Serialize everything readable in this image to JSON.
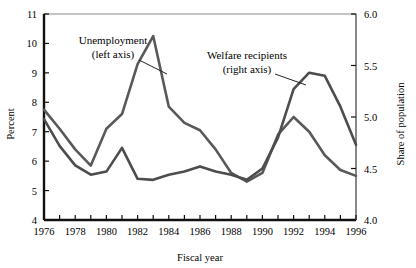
{
  "chart_data": {
    "type": "line",
    "title": "",
    "xlabel": "Fiscal year",
    "ylabel": "Percent",
    "y2label": "Share of population",
    "grid": false,
    "legend_position": "inline-annotations",
    "x": [
      1976,
      1977,
      1978,
      1979,
      1980,
      1981,
      1982,
      1983,
      1984,
      1985,
      1986,
      1987,
      1988,
      1989,
      1990,
      1991,
      1992,
      1993,
      1994,
      1995,
      1996
    ],
    "xlim": [
      1976,
      1996
    ],
    "xticks": [
      1976,
      1977,
      1978,
      1979,
      1980,
      1981,
      1982,
      1983,
      1984,
      1985,
      1986,
      1987,
      1988,
      1989,
      1990,
      1991,
      1992,
      1993,
      1994,
      1995,
      1996
    ],
    "xtick_labels": [
      "1976",
      "",
      "1978",
      "",
      "1980",
      "",
      "1982",
      "",
      "1984",
      "",
      "1986",
      "",
      "1988",
      "",
      "1990",
      "",
      "1992",
      "",
      "1994",
      "",
      "1996"
    ],
    "ylim": [
      4,
      11
    ],
    "yticks": [
      4,
      5,
      6,
      7,
      8,
      9,
      10,
      11
    ],
    "ytick_labels": [
      "4",
      "5",
      "6",
      "7",
      "8",
      "9",
      "10",
      "11"
    ],
    "y2lim": [
      4.0,
      6.0
    ],
    "y2ticks": [
      4.0,
      4.5,
      5.0,
      5.5,
      6.0
    ],
    "y2tick_labels": [
      "4.0",
      "4.5",
      "5.0",
      "5.5",
      "6.0"
    ],
    "series": [
      {
        "name": "Unemployment",
        "axis": "left",
        "color": "#595959",
        "annotation": "Unemployment\n(left axis)",
        "values": [
          7.75,
          7.1,
          6.4,
          5.85,
          7.1,
          7.6,
          9.3,
          10.25,
          7.85,
          7.3,
          7.05,
          6.4,
          5.6,
          5.3,
          5.6,
          6.9,
          7.5,
          7.0,
          6.2,
          5.7,
          5.5
        ]
      },
      {
        "name": "Welfare recipients",
        "axis": "right",
        "color": "#4d4d4d",
        "annotation": "Welfare recipients\n(right axis)",
        "values": [
          4.98,
          4.72,
          4.53,
          4.44,
          4.47,
          4.7,
          4.4,
          4.39,
          4.44,
          4.47,
          4.52,
          4.47,
          4.44,
          4.39,
          4.5,
          4.8,
          5.27,
          5.43,
          5.4,
          5.1,
          4.73
        ]
      }
    ],
    "annotations": [
      {
        "text_line1": "Unemployment",
        "text_line2": "(left axis)"
      },
      {
        "text_line1": "Welfare recipients",
        "text_line2": "(right axis)"
      }
    ]
  },
  "axes": {
    "left_title": "Percent",
    "right_title": "Share of population",
    "bottom_title": "Fiscal year"
  },
  "annotation_unemployment": {
    "line1": "Unemployment",
    "line2": "(left axis)"
  },
  "annotation_welfare": {
    "line1": "Welfare recipients",
    "line2": "(right axis)"
  }
}
